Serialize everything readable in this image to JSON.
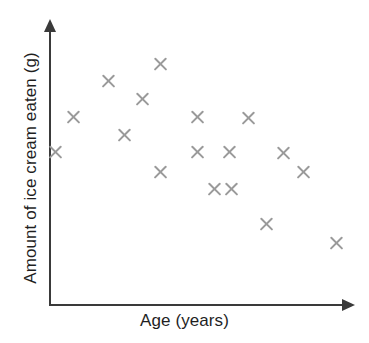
{
  "chart_data": {
    "type": "scatter",
    "title": "",
    "xlabel": "Age (years)",
    "ylabel": "Amount of ice cream eaten (g)",
    "grid": false,
    "legend": null,
    "axis_style": "arrow-headed, no tick marks, no tick labels",
    "marker_symbol": "x",
    "marker_color": "#9a9a9a",
    "axis_color": "#3a3a3a",
    "background_color": "#ffffff",
    "xlim": [
      0,
      100
    ],
    "ylim": [
      0,
      100
    ],
    "n_points": 17,
    "relationship": "negative correlation",
    "points": [
      {
        "px": 55,
        "py": 152,
        "x": 2,
        "y": 56
      },
      {
        "px": 73,
        "py": 117,
        "x": 8,
        "y": 69
      },
      {
        "px": 108,
        "py": 81,
        "x": 20,
        "y": 82
      },
      {
        "px": 124,
        "py": 135,
        "x": 25,
        "y": 62
      },
      {
        "px": 142,
        "py": 99,
        "x": 31,
        "y": 75
      },
      {
        "px": 160,
        "py": 64,
        "x": 38,
        "y": 88
      },
      {
        "px": 160,
        "py": 172,
        "x": 38,
        "y": 49
      },
      {
        "px": 197,
        "py": 117,
        "x": 50,
        "y": 69
      },
      {
        "px": 197,
        "py": 152,
        "x": 50,
        "y": 56
      },
      {
        "px": 214,
        "py": 189,
        "x": 56,
        "y": 43
      },
      {
        "px": 229,
        "py": 152,
        "x": 61,
        "y": 56
      },
      {
        "px": 231,
        "py": 189,
        "x": 62,
        "y": 43
      },
      {
        "px": 248,
        "py": 118,
        "x": 67,
        "y": 68
      },
      {
        "px": 266,
        "py": 224,
        "x": 73,
        "y": 30
      },
      {
        "px": 283,
        "py": 153,
        "x": 79,
        "y": 56
      },
      {
        "px": 303,
        "py": 172,
        "x": 86,
        "y": 49
      },
      {
        "px": 336,
        "py": 243,
        "x": 97,
        "y": 23
      }
    ]
  },
  "axes": {
    "x_label": "Age (years)",
    "y_label": "Amount of ice cream eaten (g)"
  }
}
